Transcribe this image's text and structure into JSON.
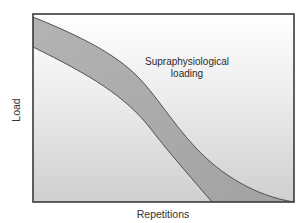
{
  "diagram": {
    "type": "band-curve",
    "x_axis_label": "Repetitions",
    "y_axis_label": "Load",
    "annotation": {
      "line1": "Supraphysiological",
      "line2": "loading"
    },
    "colors": {
      "frame": "#3a3a3a",
      "band_fill": "#a9a9a9",
      "band_edge": "#444444",
      "background_top": "#ffffff",
      "background_bottom": "#cfcfcf"
    }
  }
}
